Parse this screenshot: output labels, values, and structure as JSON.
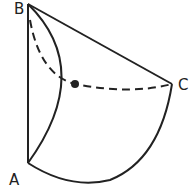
{
  "diagram": {
    "type": "geometric-figure",
    "labels": {
      "A": "A",
      "B": "B",
      "C": "C"
    },
    "points": {
      "A": [
        28,
        163
      ],
      "B": [
        28,
        4
      ],
      "C": [
        172,
        84
      ],
      "intersection": [
        75,
        84
      ]
    },
    "colors": {
      "stroke": "#222222",
      "background": "#ffffff"
    }
  }
}
